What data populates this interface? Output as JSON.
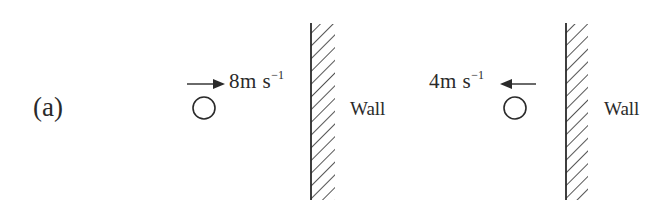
{
  "part_label": "(a)",
  "scenarios": [
    {
      "name": "before-collision",
      "speed_value": "8",
      "speed_unit": "m s",
      "speed_exponent": "−1",
      "arrow_direction": "right",
      "wall_label": "Wall"
    },
    {
      "name": "after-collision",
      "speed_value": "4",
      "speed_unit": "m s",
      "speed_exponent": "−1",
      "arrow_direction": "left",
      "wall_label": "Wall"
    }
  ],
  "colors": {
    "ink": "#2a2a2a",
    "background": "#ffffff"
  }
}
